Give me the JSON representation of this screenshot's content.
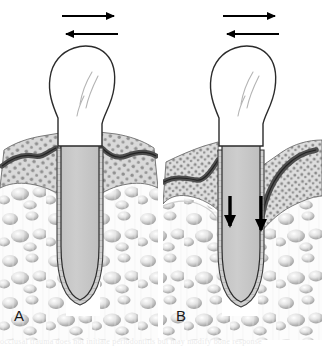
{
  "figure": {
    "width": 322,
    "height": 346,
    "background_color": "#ffffff",
    "panels": [
      {
        "id": "A",
        "label": "A",
        "description": "Tooth with normal alveolar bone height, intact gingival attachment, and widened periodontal ligament space from lateral occlusal forces",
        "force_arrows": [
          {
            "name": "lateral-force-arrow-right",
            "direction": "right",
            "color": "#000000"
          },
          {
            "name": "lateral-force-arrow-left",
            "direction": "left",
            "color": "#000000"
          }
        ],
        "vertical_arrows": []
      },
      {
        "id": "B",
        "label": "B",
        "description": "Tooth with apical migration of attachment, bone loss and deep periodontal pocket on the right side",
        "force_arrows": [
          {
            "name": "lateral-force-arrow-right",
            "direction": "right",
            "color": "#000000"
          },
          {
            "name": "lateral-force-arrow-left",
            "direction": "left",
            "color": "#000000"
          }
        ],
        "vertical_arrows": [
          {
            "name": "apical-migration-arrow-left",
            "direction": "down",
            "color": "#000000"
          },
          {
            "name": "apical-migration-arrow-right",
            "direction": "down",
            "color": "#000000"
          }
        ]
      }
    ],
    "structures": [
      {
        "name": "enamel-crown",
        "fill": "#ffffff",
        "stroke": "#2b2b2b"
      },
      {
        "name": "root-dentin",
        "fill": "#c9c9c9",
        "stroke": "#2b2b2b"
      },
      {
        "name": "gingiva-stippled",
        "fill": "#d6d6d6",
        "stroke": "#555555"
      },
      {
        "name": "junctional-epithelium-band",
        "fill": "#5a5a5a",
        "stroke": "#2b2b2b"
      },
      {
        "name": "alveolar-bone-trabecular",
        "fill": "#fcfcfc",
        "stroke": "#9a9a9a"
      },
      {
        "name": "periodontal-ligament-space",
        "fill": "#cfcfcf",
        "stroke": "#3a3a3a"
      }
    ],
    "colors": {
      "ink": "#2b2b2b",
      "arrow": "#000000",
      "gingiva": "#d6d6d6",
      "stipple_dot": "#8d8d8d",
      "epithelium": "#5a5a5a",
      "dentin": "#c9c9c9",
      "bone": "#fbfbfb",
      "bone_shadow": "#b9b9b9",
      "pdl": "#cfcfcf",
      "background": "#ffffff"
    }
  },
  "caption": {
    "partial_text": "occlusal trauma does not initiate periodontitis but may modify bone response"
  }
}
